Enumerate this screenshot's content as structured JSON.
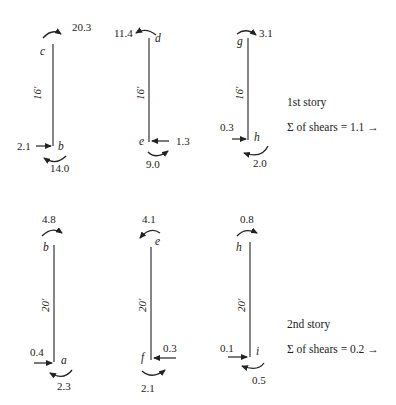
{
  "stories": [
    {
      "label": "1st story",
      "shear_sum": "Σ of shears = 1.1 →",
      "columns": [
        {
          "top_joint": "c",
          "bottom_joint": "b",
          "length": "16′",
          "top_moment": "20.3",
          "bottom_moment": "14.0",
          "shear": "2.1"
        },
        {
          "top_joint": "d",
          "bottom_joint": "e",
          "length": "16′",
          "top_moment": "11.4",
          "bottom_moment": "9.0",
          "shear": "1.3"
        },
        {
          "top_joint": "g",
          "bottom_joint": "h",
          "length": "16′",
          "top_moment": "3.1",
          "bottom_moment": "2.0",
          "shear": "0.3"
        }
      ]
    },
    {
      "label": "2nd story",
      "shear_sum": "Σ of shears = 0.2 →",
      "columns": [
        {
          "top_joint": "b",
          "bottom_joint": "a",
          "length": "20′",
          "top_moment": "4.8",
          "bottom_moment": "2.3",
          "shear": "0.4"
        },
        {
          "top_joint": "e",
          "bottom_joint": "f",
          "length": "20′",
          "top_moment": "4.1",
          "bottom_moment": "2.1",
          "shear": "0.3"
        },
        {
          "top_joint": "h",
          "bottom_joint": "i",
          "length": "20′",
          "top_moment": "0.8",
          "bottom_moment": "0.5",
          "shear": "0.1"
        }
      ]
    }
  ]
}
